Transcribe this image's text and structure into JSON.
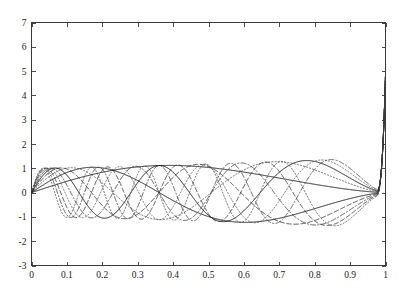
{
  "chart_data": {
    "type": "line",
    "title": "",
    "subtitle": "",
    "xlabel": "",
    "ylabel": "",
    "xlim": [
      0,
      1
    ],
    "ylim": [
      -3,
      7
    ],
    "grid": false,
    "legend": false,
    "legend_position": "none",
    "background_color": "#ffffff",
    "axis_color": "#3a3a3a",
    "xticks": [
      0,
      0.1,
      0.2,
      0.3,
      0.4,
      0.5,
      0.6,
      0.7,
      0.8,
      0.9,
      1
    ],
    "xticklabels": [
      "0",
      "0.1",
      "0.2",
      "0.3",
      "0.4",
      "0.5",
      "0.6",
      "0.7",
      "0.8",
      "0.9",
      "1"
    ],
    "yticks": [
      -3,
      -2,
      -1,
      0,
      1,
      2,
      3,
      4,
      5,
      6,
      7
    ],
    "yticklabels": [
      "-3",
      "-2",
      "-1",
      "0",
      "1",
      "2",
      "3",
      "4",
      "5",
      "6",
      "7"
    ],
    "annotations": [],
    "n_series": 10,
    "envelope": {
      "amplitude_at_x0": 1.0,
      "amplitude_at_x_mid": 1.2,
      "amplitude_at_x090": 1.45,
      "endpoint_spike_value": 4.8,
      "spike_onset_x": 0.975
    },
    "series": [
      {
        "name": "mode 1",
        "mode": 1,
        "linestyle": "solid",
        "color": "#111111",
        "half_oscillations": 1,
        "endpoint_value": 4.8,
        "x": [
          0,
          0.05,
          0.1,
          0.15,
          0.2,
          0.25,
          0.3,
          0.35,
          0.4,
          0.45,
          0.5,
          0.55,
          0.6,
          0.65,
          0.7,
          0.75,
          0.8,
          0.85,
          0.9,
          0.95,
          0.98,
          0.99,
          1
        ],
        "y": [
          0,
          0.32,
          0.52,
          0.68,
          0.8,
          0.9,
          0.98,
          1.04,
          1.09,
          1.14,
          1.18,
          1.21,
          1.24,
          1.27,
          1.29,
          1.32,
          1.34,
          1.36,
          1.38,
          1.41,
          1.55,
          2.2,
          4.8
        ]
      },
      {
        "name": "mode 2",
        "mode": 2,
        "linestyle": "solid",
        "color": "#111111",
        "half_oscillations": 2,
        "endpoint_value": 4.8,
        "x": [
          0,
          0.05,
          0.1,
          0.2,
          0.3,
          0.4,
          0.5,
          0.6,
          0.7,
          0.8,
          0.9,
          0.95,
          0.98,
          0.99,
          1
        ],
        "y": [
          0,
          0.72,
          1.02,
          1.05,
          0.66,
          0.02,
          -0.66,
          -1.09,
          -1.18,
          -0.9,
          -0.2,
          0.35,
          1.2,
          2.2,
          4.8
        ]
      },
      {
        "name": "mode 3",
        "mode": 3,
        "linestyle": "dotted",
        "color": "#444444",
        "half_oscillations": 3,
        "endpoint_value": 4.8,
        "x": [
          0,
          0.04,
          0.1,
          0.18,
          0.26,
          0.34,
          0.42,
          0.5,
          0.58,
          0.66,
          0.74,
          0.82,
          0.9,
          0.95,
          0.98,
          0.99,
          1
        ],
        "y": [
          0,
          0.78,
          1.0,
          0.48,
          -0.35,
          -0.98,
          -1.1,
          -0.55,
          0.3,
          1.0,
          1.15,
          0.62,
          -0.3,
          -0.85,
          0.5,
          2.0,
          4.8
        ]
      },
      {
        "name": "mode 4",
        "mode": 4,
        "linestyle": "dashed",
        "color": "#222222",
        "half_oscillations": 4,
        "endpoint_value": 4.8,
        "x": [
          0,
          0.035,
          0.09,
          0.15,
          0.21,
          0.28,
          0.35,
          0.42,
          0.49,
          0.56,
          0.63,
          0.7,
          0.77,
          0.84,
          0.9,
          0.95,
          0.98,
          0.99,
          1
        ],
        "y": [
          0,
          0.8,
          0.92,
          0.25,
          -0.68,
          -1.12,
          -0.7,
          0.18,
          0.95,
          1.12,
          0.6,
          -0.3,
          -1.05,
          -1.15,
          -0.5,
          0.6,
          1.4,
          2.3,
          4.8
        ]
      },
      {
        "name": "mode 5",
        "mode": 5,
        "linestyle": "solid",
        "color": "#111111",
        "half_oscillations": 5,
        "endpoint_value": 4.8,
        "x": [
          0,
          0.03,
          0.08,
          0.13,
          0.19,
          0.25,
          0.31,
          0.37,
          0.43,
          0.49,
          0.55,
          0.61,
          0.67,
          0.73,
          0.79,
          0.85,
          0.9,
          0.95,
          0.98,
          0.99,
          1
        ],
        "y": [
          0,
          0.82,
          0.82,
          0.05,
          -0.85,
          -1.0,
          -0.3,
          0.7,
          1.1,
          0.6,
          -0.35,
          -1.1,
          -1.0,
          -0.1,
          0.9,
          1.25,
          0.7,
          -0.5,
          0.9,
          2.1,
          4.8
        ]
      },
      {
        "name": "mode 6",
        "mode": 6,
        "linestyle": "dashdot",
        "color": "#333333",
        "half_oscillations": 6,
        "endpoint_value": 4.8,
        "x": [
          0,
          0.028,
          0.07,
          0.11,
          0.16,
          0.21,
          0.26,
          0.31,
          0.37,
          0.43,
          0.49,
          0.55,
          0.61,
          0.67,
          0.73,
          0.79,
          0.85,
          0.9,
          0.95,
          0.98,
          0.99,
          1
        ],
        "y": [
          0,
          0.85,
          0.7,
          -0.2,
          -1.0,
          -0.7,
          0.3,
          1.05,
          0.85,
          -0.15,
          -1.05,
          -0.95,
          0.1,
          1.05,
          1.05,
          0.05,
          -1.0,
          -1.2,
          0.2,
          1.5,
          2.4,
          4.8
        ]
      },
      {
        "name": "mode 7",
        "mode": 7,
        "linestyle": "dotted",
        "color": "#555555",
        "half_oscillations": 7,
        "endpoint_value": 4.8,
        "x": [
          0,
          0.025,
          0.06,
          0.1,
          0.14,
          0.19,
          0.24,
          0.29,
          0.34,
          0.4,
          0.46,
          0.52,
          0.58,
          0.64,
          0.7,
          0.76,
          0.82,
          0.88,
          0.93,
          0.96,
          0.98,
          0.99,
          1
        ],
        "y": [
          0,
          0.86,
          0.55,
          -0.45,
          -0.95,
          -0.3,
          0.8,
          0.95,
          0.0,
          -1.0,
          -0.75,
          0.45,
          1.1,
          0.6,
          -0.6,
          -1.2,
          -0.55,
          0.85,
          1.45,
          0.9,
          1.6,
          2.5,
          4.8
        ]
      },
      {
        "name": "mode 8",
        "mode": 8,
        "linestyle": "dashed",
        "color": "#2a2a2a",
        "half_oscillations": 8,
        "endpoint_value": 4.8,
        "x": [
          0,
          0.022,
          0.055,
          0.09,
          0.13,
          0.17,
          0.21,
          0.26,
          0.31,
          0.36,
          0.41,
          0.47,
          0.53,
          0.59,
          0.65,
          0.71,
          0.77,
          0.83,
          0.89,
          0.93,
          0.96,
          0.98,
          0.99,
          1
        ],
        "y": [
          0,
          0.88,
          0.35,
          -0.7,
          -0.7,
          0.45,
          1.0,
          0.2,
          -0.95,
          -0.8,
          0.45,
          1.1,
          0.45,
          -0.85,
          -1.1,
          0.1,
          1.2,
          0.95,
          -0.75,
          -1.5,
          -0.3,
          1.7,
          2.6,
          4.8
        ]
      },
      {
        "name": "mode 9",
        "mode": 9,
        "linestyle": "dashdot",
        "color": "#3a3a3a",
        "half_oscillations": 9,
        "endpoint_value": 4.8,
        "x": [
          0,
          0.02,
          0.05,
          0.08,
          0.115,
          0.15,
          0.19,
          0.23,
          0.275,
          0.32,
          0.37,
          0.42,
          0.47,
          0.53,
          0.59,
          0.65,
          0.71,
          0.77,
          0.83,
          0.88,
          0.92,
          0.95,
          0.97,
          0.985,
          0.995,
          1
        ],
        "y": [
          0,
          0.9,
          0.2,
          -0.85,
          -0.4,
          0.85,
          0.7,
          -0.55,
          -1.0,
          0.15,
          1.1,
          0.5,
          -0.85,
          -1.0,
          0.35,
          1.2,
          0.6,
          -1.0,
          -1.25,
          0.45,
          1.6,
          0.9,
          -1.9,
          0.4,
          2.7,
          4.8
        ]
      },
      {
        "name": "mode 10",
        "mode": 10,
        "linestyle": "dotted",
        "color": "#4a4a4a",
        "half_oscillations": 10,
        "endpoint_value": 4.8,
        "x": [
          0,
          0.018,
          0.045,
          0.075,
          0.105,
          0.14,
          0.175,
          0.21,
          0.25,
          0.29,
          0.335,
          0.38,
          0.43,
          0.48,
          0.54,
          0.6,
          0.66,
          0.72,
          0.78,
          0.84,
          0.89,
          0.93,
          0.96,
          0.98,
          0.99,
          1
        ],
        "y": [
          0,
          0.9,
          0.05,
          -0.9,
          -0.1,
          0.95,
          0.35,
          -0.9,
          -0.6,
          0.8,
          0.85,
          -0.5,
          -1.1,
          0.2,
          1.15,
          0.45,
          -1.0,
          -1.0,
          0.7,
          1.35,
          0.0,
          -1.9,
          -0.9,
          2.0,
          2.8,
          4.8
        ]
      }
    ]
  }
}
